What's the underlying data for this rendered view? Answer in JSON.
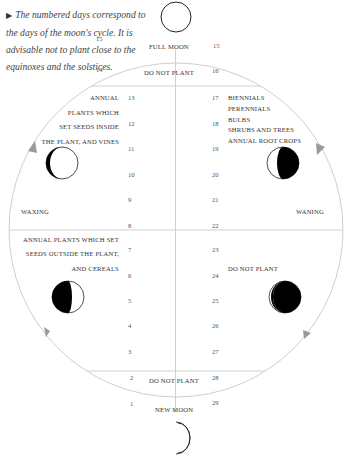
{
  "caption": {
    "marker": "▶",
    "text": "The numbered days correspond to the days of the moon's cycle. It is advisable not to plant close to the equinoxes and the solstices."
  },
  "top": {
    "full_moon": "FULL MOON",
    "do_not_plant": "DO NOT PLANT",
    "left_day_a": "15",
    "right_day_a": "15",
    "left_day_b": "14",
    "right_day_b": "16"
  },
  "bottom": {
    "new_moon": "NEW MOON",
    "do_not_plant": "DO NOT PLANT",
    "left_day_a": "2",
    "right_day_a": "28",
    "left_day_b": "1",
    "right_day_b": "29"
  },
  "upper_left": {
    "lines": [
      "ANNUAL",
      "PLANTS WHICH",
      "SET SEEDS INSIDE",
      "THE PLANT, AND VINES"
    ],
    "days": [
      "13",
      "12",
      "11",
      "10",
      "9",
      "8"
    ]
  },
  "upper_right": {
    "lines": [
      "BIENNIALS",
      "PERENNIALS",
      "BULBS",
      "SHRUBS AND TREES",
      "ANNUAL ROOT CROPS"
    ],
    "days": [
      "17",
      "18",
      "19",
      "20",
      "21",
      "22"
    ]
  },
  "lower_left": {
    "lines": [
      "ANNUAL PLANTS WHICH SET",
      "SEEDS OUTSIDE THE PLANT,",
      "AND CEREALS"
    ],
    "days": [
      "7",
      "6",
      "5",
      "4",
      "3"
    ]
  },
  "lower_right": {
    "text": "DO NOT PLANT",
    "days": [
      "23",
      "24",
      "25",
      "26",
      "27"
    ]
  },
  "phases": {
    "waxing": "WAXING",
    "waning": "WANING"
  },
  "icons": [
    "full-moon-icon",
    "waxing-crescent-icon",
    "waning-gibbous-icon",
    "waxing-gibbous-icon",
    "waning-crescent-icon",
    "new-moon-crescent-icon",
    "direction-arrow-icon"
  ],
  "colors": {
    "circle": "#cfcfcf",
    "arrow": "#9a9a9a",
    "moon_dark": "#000000",
    "text": "#333333"
  }
}
